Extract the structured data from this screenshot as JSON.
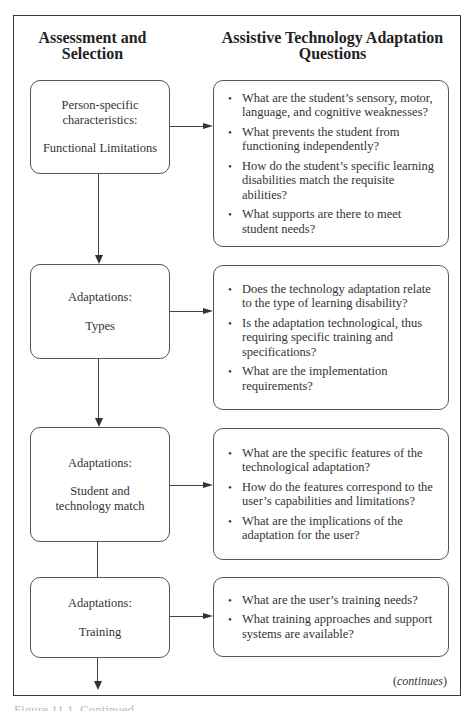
{
  "headers": {
    "left": "Assessment and Selection",
    "right": "Assistive Technology Adaptation Questions"
  },
  "steps": [
    {
      "label_top": "Person-specific characteristics:",
      "label_bottom": "Functional Limitations",
      "questions": [
        "What are the student’s sensory, motor, language, and cognitive weaknesses?",
        "What prevents the student from functioning independently?",
        "How do the student’s specific learning disabilities match the requisite abilities?",
        "What supports are there to meet student needs?"
      ]
    },
    {
      "label_top": "Adaptations:",
      "label_bottom": "Types",
      "questions": [
        "Does the technology adaptation relate to the type of learning disability?",
        "Is the adaptation technological, thus requiring specific training and specifications?",
        "What are the implementation requirements?"
      ]
    },
    {
      "label_top": "Adaptations:",
      "label_bottom": "Student and technology match",
      "questions": [
        "What are the specific features of the technological adaptation?",
        "How do the features correspond to the user’s capabilities and limitations?",
        "What are the implications of the adaptation for the user?"
      ]
    },
    {
      "label_top": "Adaptations:",
      "label_bottom": "Training",
      "questions": [
        "What are the user’s training needs?",
        "What training approaches and support systems are available?"
      ]
    }
  ],
  "footer": {
    "continues_open": "(",
    "continues_text": "continues",
    "continues_close": ")",
    "caption_partial": "Figure 11.1. Continued"
  }
}
